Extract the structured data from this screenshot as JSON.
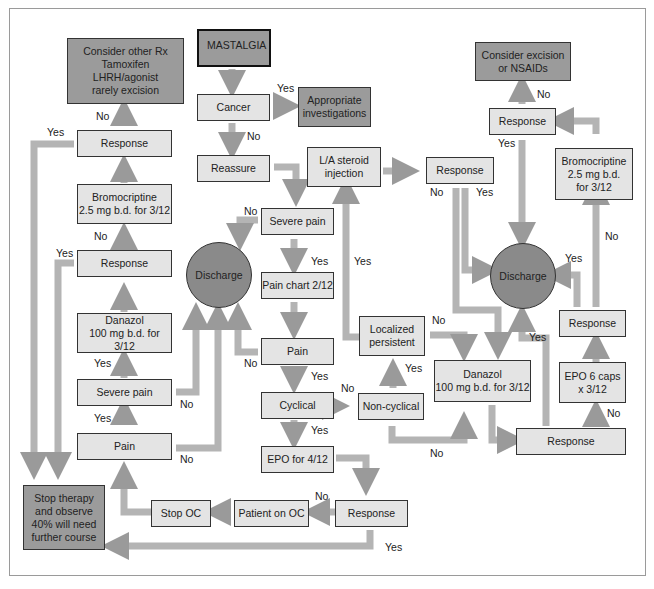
{
  "diagram": {
    "title": "MASTALGIA",
    "nodes": {
      "mastalgia": "MASTALGIA",
      "cancer": "Cancer",
      "appropriate_investigations": "Appropriate\ninvestigations",
      "reassure": "Reassure",
      "la_steroid": "L/A steroid\ninjection",
      "response_steroid": "Response",
      "severe_pain_center": "Severe pain",
      "pain_chart": "Pain chart 2/12",
      "pain_center": "Pain",
      "cyclical": "Cyclical",
      "non_cyclical": "Non-cyclical",
      "localized_persistent": "Localized\npersistent",
      "epo_4_12": "EPO for 4/12",
      "response_epo": "Response",
      "patient_on_oc": "Patient on OC",
      "stop_oc": "Stop OC",
      "stop_therapy": "Stop therapy\nand observe\n40% will need\nfurther course",
      "pain_left": "Pain",
      "severe_pain_left": "Severe pain",
      "danazol_left": "Danazol\n100 mg b.d. for 3/12",
      "response_left_lower": "Response",
      "bromocriptine_left": "Bromocriptine\n2.5 mg b.d. for 3/12",
      "response_left_upper": "Response",
      "consider_other_rx": "Consider other Rx\nTamoxifen\nLHRH/agonist\nrarely excision",
      "discharge_left": "Discharge",
      "discharge_right": "Discharge",
      "danazol_right": "Danazol\n100 mg b.d. for 3/12",
      "response_right_lower": "Response",
      "epo_6_caps": "EPO 6 caps\nx 3/12",
      "response_right_mid": "Response",
      "bromocriptine_right": "Bromocriptine\n2.5 mg b.d.\nfor 3/12",
      "response_right_upper": "Response",
      "consider_excision": "Consider excision\nor NSAIDs"
    },
    "labels": {
      "yes": "Yes",
      "no": "No"
    },
    "colors": {
      "box_fill": "#e4e4e4",
      "terminal_fill": "#9b9b9b",
      "discharge_fill": "#8a8a8a",
      "arrow": "#a8a8a8",
      "border": "#333333"
    }
  }
}
